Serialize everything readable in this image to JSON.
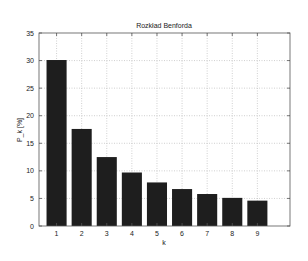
{
  "chart_data": {
    "type": "bar",
    "title": "Rozkład Benforda",
    "xlabel": "k",
    "ylabel": "P_k [%]",
    "categories": [
      "1",
      "2",
      "3",
      "4",
      "5",
      "6",
      "7",
      "8",
      "9"
    ],
    "values": [
      30.1,
      17.6,
      12.5,
      9.7,
      7.9,
      6.7,
      5.8,
      5.1,
      4.6
    ],
    "ylim": [
      0,
      35
    ],
    "xlim": [
      0.3,
      10.3
    ],
    "yticks": [
      0,
      5,
      10,
      15,
      20,
      25,
      30,
      35
    ],
    "xticks": [
      1,
      2,
      3,
      4,
      5,
      6,
      7,
      8,
      9
    ],
    "grid": true,
    "legend": null,
    "bar_color": "#1e1e1e",
    "grid_color": "#b0b0b0"
  }
}
